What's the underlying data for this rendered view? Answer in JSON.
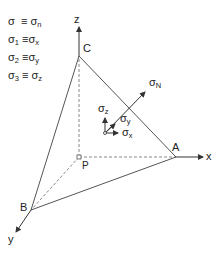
{
  "legend": [
    {
      "lhs": "σ",
      "lhs_sub": "",
      "eq": "≡",
      "rhs": "σ",
      "rhs_sub": "n"
    },
    {
      "lhs": "σ",
      "lhs_sub": "1",
      "eq": "≡",
      "rhs": "σ",
      "rhs_sub": "x"
    },
    {
      "lhs": "σ",
      "lhs_sub": "2",
      "eq": "≡",
      "rhs": "σ",
      "rhs_sub": "y"
    },
    {
      "lhs": "σ",
      "lhs_sub": "3",
      "eq": "≡",
      "rhs": "σ",
      "rhs_sub": "z"
    }
  ],
  "axes": {
    "x": "x",
    "y": "y",
    "z": "z"
  },
  "vertices": {
    "A": "A",
    "B": "B",
    "C": "C",
    "P": "P"
  },
  "stress": {
    "sigma": "σ",
    "N_sub": "N",
    "x_sub": "x",
    "y_sub": "y",
    "z_sub": "z"
  },
  "colors": {
    "line": "#555555",
    "dashed": "#777777",
    "text": "#222222"
  }
}
